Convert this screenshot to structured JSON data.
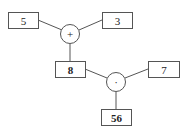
{
  "diagram": {
    "nodes": {
      "input_a": "5",
      "input_b": "3",
      "op_add": "+",
      "intermediate": "8",
      "input_c": "7",
      "op_mul": "·",
      "output": "56"
    },
    "edges": [
      [
        "input_a",
        "op_add"
      ],
      [
        "input_b",
        "op_add"
      ],
      [
        "op_add",
        "intermediate"
      ],
      [
        "intermediate",
        "op_mul"
      ],
      [
        "input_c",
        "op_mul"
      ],
      [
        "op_mul",
        "output"
      ]
    ]
  }
}
